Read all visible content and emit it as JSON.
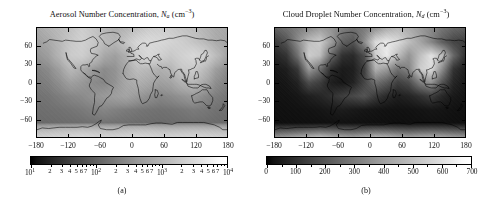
{
  "figure": {
    "panels": [
      {
        "id": "a",
        "caption": "(a)",
        "title": {
          "text_plain": "Aerosol Number Concentration, N_a (cm^-3)",
          "prefix": "Aerosol Number Concentration, ",
          "variable": "N",
          "subscript": "a",
          "units_open": " (cm",
          "units_exp": "−3",
          "units_close": ")"
        },
        "colorbar": {
          "scale": "log",
          "vmin": 10,
          "vmax": 10000,
          "major_labels": [
            "10¹",
            "10²",
            "10³",
            "10⁴"
          ],
          "major_values": [
            10,
            100,
            1000,
            10000
          ],
          "minor_labels": [
            "2",
            "3",
            "4",
            "5",
            "6",
            "7"
          ],
          "cmap": "grayscale-dark-to-light"
        }
      },
      {
        "id": "b",
        "caption": "(b)",
        "title": {
          "text_plain": "Cloud Droplet Number Concentration, N_d (cm^-3)",
          "prefix": "Cloud Droplet Number Concentration, ",
          "variable": "N",
          "subscript": "d",
          "units_open": " (cm",
          "units_exp": "−3",
          "units_close": ")"
        },
        "colorbar": {
          "scale": "linear",
          "vmin": 0,
          "vmax": 700,
          "major_labels": [
            "0",
            "100",
            "200",
            "300",
            "400",
            "500",
            "600",
            "700"
          ],
          "major_values": [
            0,
            100,
            200,
            300,
            400,
            500,
            600,
            700
          ],
          "minor_labels": [],
          "cmap": "grayscale-dark-to-light"
        }
      }
    ],
    "axes": {
      "x_label_values": [
        -180,
        -120,
        -60,
        0,
        60,
        120,
        180
      ],
      "x_labels": [
        "−180",
        "−120",
        "−60",
        "0",
        "60",
        "120",
        "180"
      ],
      "y_label_values": [
        60,
        30,
        0,
        -30,
        -60
      ],
      "y_labels": [
        "60",
        "30",
        "0",
        "−30",
        "−60"
      ],
      "xlim": [
        -180,
        180
      ],
      "ylim": [
        -90,
        90
      ],
      "projection": "cylindrical-equidistant"
    },
    "colors": {
      "background": "#ffffff",
      "foreground": "#000000",
      "ocean_mid": "#9a9a9a",
      "coastline": "#000000"
    }
  },
  "chart_data": {
    "type": "heatmap",
    "xlabel": "",
    "ylabel": "",
    "grid": false,
    "legend": "colorbar-below-each-panel",
    "maps": [
      {
        "panel": "a",
        "title": "Aerosol Number Concentration, N_a (cm^-3)",
        "scale": "log",
        "vmin": 10,
        "vmax": 10000,
        "units": "cm^-3",
        "lon_centers": [
          -170,
          -150,
          -130,
          -110,
          -90,
          -70,
          -50,
          -30,
          -10,
          10,
          30,
          50,
          70,
          90,
          110,
          130,
          150,
          170
        ],
        "lat_centers": [
          80,
          60,
          40,
          20,
          0,
          -20,
          -40,
          -60,
          -80
        ],
        "values": [
          [
            900,
            1200,
            1500,
            1800,
            2600,
            2000,
            1400,
            1100,
            1300,
            1800,
            2400,
            2600,
            2400,
            2000,
            1700,
            1300,
            1000,
            900
          ],
          [
            700,
            900,
            1400,
            2200,
            2800,
            2200,
            1500,
            1300,
            2000,
            3200,
            3600,
            3400,
            3000,
            2600,
            2000,
            1500,
            1000,
            800
          ],
          [
            500,
            700,
            1300,
            2400,
            2600,
            1700,
            900,
            700,
            1100,
            2600,
            3400,
            2800,
            2200,
            2800,
            3400,
            2800,
            1600,
            800
          ],
          [
            300,
            400,
            700,
            1400,
            1000,
            600,
            400,
            500,
            900,
            1600,
            1400,
            1100,
            1300,
            2200,
            2400,
            1500,
            700,
            400
          ],
          [
            250,
            300,
            450,
            700,
            600,
            400,
            350,
            500,
            900,
            1100,
            900,
            700,
            800,
            1200,
            1400,
            900,
            450,
            300
          ],
          [
            200,
            220,
            280,
            350,
            400,
            500,
            600,
            700,
            800,
            600,
            450,
            350,
            400,
            500,
            600,
            400,
            280,
            220
          ],
          [
            180,
            190,
            200,
            220,
            250,
            300,
            350,
            300,
            260,
            230,
            210,
            200,
            210,
            230,
            260,
            240,
            200,
            185
          ],
          [
            160,
            165,
            170,
            175,
            180,
            190,
            200,
            195,
            185,
            175,
            170,
            165,
            170,
            175,
            185,
            180,
            170,
            162
          ],
          [
            2500,
            2600,
            2800,
            3000,
            3200,
            3000,
            2800,
            2700,
            2900,
            3100,
            3000,
            2800,
            2700,
            2800,
            2900,
            2800,
            2650,
            2550
          ]
        ]
      },
      {
        "panel": "b",
        "title": "Cloud Droplet Number Concentration, N_d (cm^-3)",
        "scale": "linear",
        "vmin": 0,
        "vmax": 700,
        "units": "cm^-3",
        "lon_centers": [
          -170,
          -150,
          -130,
          -110,
          -90,
          -70,
          -50,
          -30,
          -10,
          10,
          30,
          50,
          70,
          90,
          110,
          130,
          150,
          170
        ],
        "lat_centers": [
          80,
          60,
          40,
          20,
          0,
          -20,
          -40,
          -60,
          -80
        ],
        "values": [
          [
            260,
            300,
            340,
            380,
            430,
            400,
            340,
            300,
            330,
            400,
            470,
            500,
            470,
            420,
            370,
            310,
            270,
            255
          ],
          [
            150,
            220,
            380,
            520,
            560,
            430,
            260,
            220,
            380,
            600,
            640,
            600,
            520,
            450,
            360,
            250,
            180,
            160
          ],
          [
            90,
            130,
            300,
            560,
            520,
            280,
            120,
            100,
            200,
            560,
            640,
            520,
            400,
            520,
            620,
            520,
            280,
            130
          ],
          [
            50,
            70,
            140,
            420,
            300,
            110,
            60,
            70,
            160,
            480,
            420,
            300,
            360,
            560,
            600,
            380,
            130,
            70
          ],
          [
            40,
            50,
            80,
            200,
            160,
            70,
            50,
            80,
            180,
            300,
            240,
            160,
            200,
            340,
            400,
            220,
            90,
            55
          ],
          [
            35,
            38,
            48,
            70,
            90,
            120,
            160,
            190,
            220,
            150,
            100,
            70,
            85,
            120,
            160,
            95,
            55,
            40
          ],
          [
            30,
            32,
            34,
            38,
            44,
            55,
            65,
            55,
            46,
            40,
            36,
            34,
            36,
            40,
            46,
            42,
            34,
            31
          ],
          [
            26,
            27,
            28,
            29,
            30,
            32,
            34,
            33,
            31,
            29,
            28,
            27,
            28,
            29,
            31,
            30,
            28,
            26
          ],
          [
            380,
            400,
            430,
            460,
            490,
            460,
            430,
            410,
            440,
            470,
            460,
            430,
            410,
            430,
            440,
            430,
            405,
            390
          ]
        ]
      }
    ]
  }
}
